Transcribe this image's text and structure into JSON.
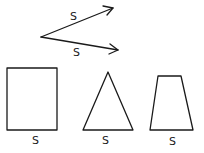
{
  "diagram": {
    "vectors": [
      {
        "label": "S",
        "from": [
          41,
          37
        ],
        "to": [
          113,
          8
        ],
        "label_pos": [
          75,
          19
        ]
      },
      {
        "label": "S",
        "from": [
          41,
          37
        ],
        "to": [
          118,
          50
        ],
        "label_pos": [
          77,
          55
        ]
      }
    ],
    "shapes": [
      {
        "type": "rectangle",
        "label": "S",
        "label_pos": [
          32,
          143
        ]
      },
      {
        "type": "triangle",
        "label": "S",
        "label_pos": [
          102,
          143
        ]
      },
      {
        "type": "trapezoid",
        "label": "S",
        "label_pos": [
          169,
          144
        ]
      }
    ],
    "colors": {
      "ink": "#1a1a1a",
      "background": "#ffffff"
    }
  }
}
